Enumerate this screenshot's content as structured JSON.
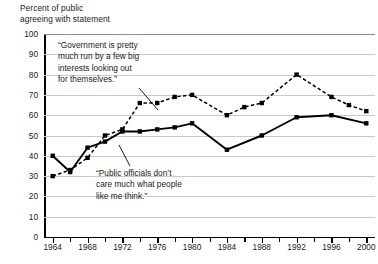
{
  "axis_title": "Percent of public\nagreeing with statement",
  "annotations": {
    "government": "“Government is pretty\n much run by a few big\n interests looking out\n for themselves.”",
    "officials": "“Public officials don’t\n care much what people\n like me think.”"
  },
  "chart_data": {
    "type": "line",
    "title": "Percent of public agreeing with statement",
    "xlabel": "",
    "ylabel": "Percent of public agreeing with statement",
    "xlim": [
      1963,
      2001
    ],
    "ylim": [
      0,
      100
    ],
    "ytick_step": 10,
    "xtick_step": 2,
    "xtick_label_step": 4,
    "grid": true,
    "legend": "none",
    "yticks": [
      0,
      10,
      20,
      30,
      40,
      50,
      60,
      70,
      80,
      90,
      100
    ],
    "xticks": [
      1964,
      1966,
      1968,
      1970,
      1972,
      1974,
      1976,
      1978,
      1980,
      1982,
      1984,
      1986,
      1988,
      1990,
      1992,
      1994,
      1996,
      1998,
      2000
    ],
    "xtick_labels": [
      "1964",
      "1968",
      "1972",
      "1976",
      "1980",
      "1984",
      "1988",
      "1992",
      "1996",
      "2000"
    ],
    "series": [
      {
        "name": "Government is pretty much run by a few big interests looking out for themselves.",
        "style": "dashed",
        "color": "#000000",
        "marker": "square",
        "x": [
          1964,
          1966,
          1968,
          1970,
          1972,
          1974,
          1976,
          1978,
          1980,
          1984,
          1986,
          1988,
          1992,
          1996,
          1998,
          2000
        ],
        "values": [
          30,
          33,
          39,
          50,
          53,
          66,
          66,
          69,
          70,
          60,
          64,
          66,
          80,
          69,
          65,
          62
        ]
      },
      {
        "name": "Public officials don't care much what people like me think.",
        "style": "solid",
        "color": "#000000",
        "marker": "square",
        "x": [
          1964,
          1966,
          1968,
          1970,
          1972,
          1974,
          1976,
          1978,
          1980,
          1984,
          1988,
          1992,
          1996,
          2000
        ],
        "values": [
          40,
          32,
          44,
          47,
          52,
          52,
          53,
          54,
          56,
          43,
          50,
          59,
          60,
          56
        ]
      }
    ],
    "annotations": [
      {
        "text": "“Government is pretty much run by a few big interests looking out for themselves.”",
        "points_to_series": 0,
        "points_to_x": 1976
      },
      {
        "text": "“Public officials don’t care much what people like me think.”",
        "points_to_series": 1,
        "points_to_x": 1974
      }
    ]
  }
}
